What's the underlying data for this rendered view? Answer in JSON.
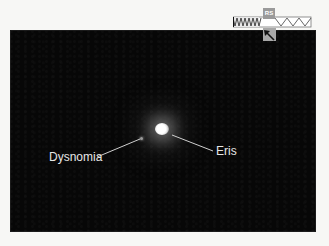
{
  "figure": {
    "labels": {
      "moon": "Dysnomia",
      "planet": "Eris"
    },
    "compass": {
      "box_label": "RS",
      "arrow_icon": "direction-arrow-icon"
    },
    "colors": {
      "background": "#070707",
      "label_text": "#e6e6e6",
      "leader_line": "#cfcfcf",
      "page": "#f7f7f5"
    }
  }
}
